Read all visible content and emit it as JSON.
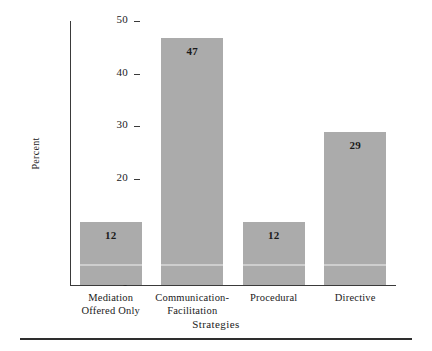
{
  "chart_data": {
    "type": "bar",
    "title": "",
    "subtitle": "",
    "xlabel": "Strategies",
    "ylabel": "Percent",
    "categories": [
      "Mediation\nOffered Only",
      "Communication-\nFacilitation",
      "Procedural",
      "Directive"
    ],
    "category_lines": [
      [
        "Mediation",
        "Offered Only"
      ],
      [
        "Communication-",
        "Facilitation"
      ],
      [
        "Procedural",
        ""
      ],
      [
        "Directive",
        ""
      ]
    ],
    "values": [
      12,
      47,
      12,
      29
    ],
    "value_labels": [
      "12",
      "47",
      "12",
      "29"
    ],
    "ylim": [
      0,
      50
    ],
    "yticks": [
      0,
      10,
      20,
      30,
      40,
      50
    ],
    "ytick_labels": [
      "0",
      "10",
      "20",
      "30",
      "40",
      "50"
    ],
    "grid": false,
    "legend": false,
    "legend_position": "none",
    "bar_color": "#ababab",
    "axis_color": "#3a3a3a",
    "text_color": "#1a1a1a"
  }
}
